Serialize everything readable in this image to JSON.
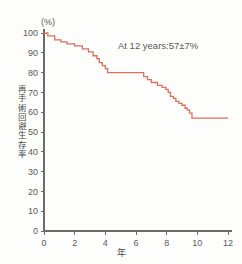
{
  "chart_data": {
    "type": "line",
    "title": "",
    "subtitle": "",
    "xlabel": "年",
    "ylabel": "再手術回避生存率",
    "yunit": "(%)",
    "xlim": [
      0,
      12
    ],
    "ylim": [
      0,
      100
    ],
    "xticks": [
      0,
      2,
      4,
      6,
      8,
      10,
      12
    ],
    "xtick_labels": [
      "0",
      "2",
      "4",
      "6",
      "8",
      "10",
      "12"
    ],
    "yticks": [
      0,
      10,
      20,
      30,
      40,
      50,
      60,
      70,
      80,
      90,
      100
    ],
    "ytick_labels": [
      "0",
      "10",
      "20",
      "30",
      "40",
      "50",
      "60",
      "70",
      "80",
      "90",
      "100"
    ],
    "grid": false,
    "legend": false,
    "line_color": "#d9705f",
    "step_style": "post",
    "annotations": [
      {
        "text": "At 12 years:57±7%",
        "x": 5.6,
        "y": 90
      }
    ],
    "series": [
      {
        "name": "再手術回避生存率",
        "color": "#d9705f",
        "x": [
          0.0,
          0.25,
          0.7,
          1.1,
          1.5,
          2.0,
          2.5,
          2.9,
          3.2,
          3.45,
          3.6,
          3.8,
          4.0,
          4.15,
          6.2,
          6.5,
          6.75,
          7.0,
          7.4,
          7.7,
          7.95,
          8.1,
          8.25,
          8.45,
          8.6,
          8.8,
          9.0,
          9.2,
          9.35,
          9.5,
          9.65,
          12.0
        ],
        "y": [
          100,
          98.5,
          96.5,
          95.5,
          94.5,
          93.5,
          92.0,
          90.5,
          88.5,
          87.0,
          85.0,
          83.5,
          82.0,
          80.0,
          80.0,
          78.0,
          76.5,
          75.0,
          73.5,
          72.5,
          71.5,
          70.0,
          68.0,
          67.0,
          65.5,
          64.5,
          63.5,
          62.0,
          61.0,
          59.5,
          57.0,
          57.0
        ]
      }
    ]
  }
}
